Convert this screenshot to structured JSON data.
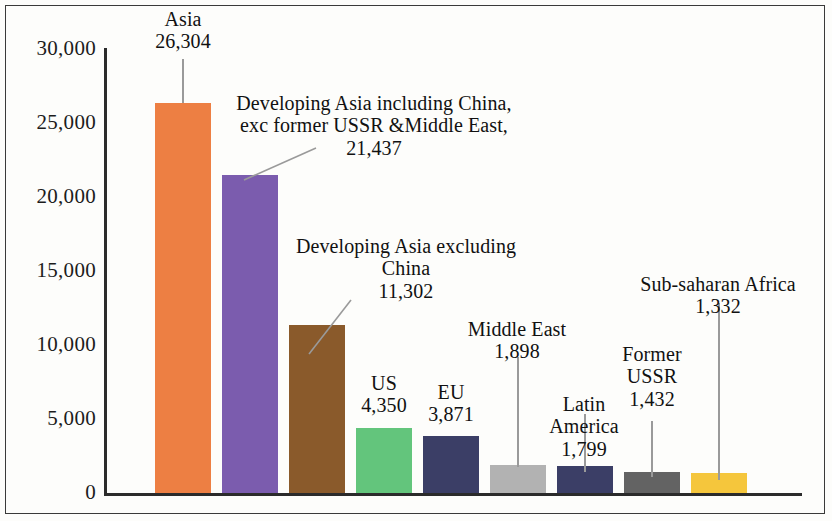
{
  "chart_data": {
    "type": "bar",
    "title": "",
    "subtitle": "",
    "xlabel": "",
    "ylabel": "",
    "ylim": [
      0,
      30000
    ],
    "grid": false,
    "legend": "none",
    "axis": {
      "y_ticks": [
        "0",
        "5,000",
        "10,000",
        "15,000",
        "20,000",
        "25,000",
        "30,000"
      ],
      "y_tick_values": [
        0,
        5000,
        10000,
        15000,
        20000,
        25000,
        30000
      ],
      "x_ticks": []
    },
    "categories": [
      "Asia",
      "Developing Asia including China, exc former USSR &Middle East",
      "Developing Asia excluding China",
      "US",
      "EU",
      "Middle East",
      "Latin America",
      "Former USSR",
      "Sub-saharan Africa"
    ],
    "values": [
      26304,
      21437,
      11302,
      4350,
      3871,
      1898,
      1799,
      1432,
      1332
    ],
    "value_labels": [
      "26,304",
      "21,437",
      "11,302",
      "4,350",
      "3,871",
      "1,898",
      "1,799",
      "1,432",
      "1,332"
    ],
    "colors": [
      "#ED7F43",
      "#7B5CAE",
      "#8A5A2B",
      "#63C57C",
      "#3B3E66",
      "#B2B2B2",
      "#3B3E66",
      "#636363",
      "#F5C63C"
    ]
  },
  "annotations": [
    {
      "name": "asia",
      "text": "Asia\n26,304"
    },
    {
      "name": "developing-asia-including-china",
      "text": "Developing Asia including China,\nexc former USSR &Middle East,\n21,437"
    },
    {
      "name": "developing-asia-excluding-china",
      "text": "Developing Asia excluding\nChina\n11,302"
    },
    {
      "name": "us",
      "text": "US\n4,350"
    },
    {
      "name": "eu",
      "text": "EU\n3,871"
    },
    {
      "name": "middle-east",
      "text": "Middle East\n1,898"
    },
    {
      "name": "latin-america",
      "text": "Latin\nAmerica\n1,799"
    },
    {
      "name": "former-ussr",
      "text": "Former\nUSSR\n1,432"
    },
    {
      "name": "sub-saharan-africa",
      "text": "Sub-saharan Africa\n1,332"
    }
  ]
}
